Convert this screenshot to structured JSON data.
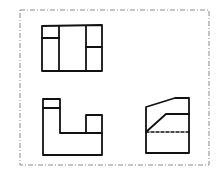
{
  "diagram": {
    "type": "orthographic-three-view-drawing",
    "colors": {
      "line": "#111111",
      "border": "#8a8a8a",
      "background": "#ffffff"
    },
    "border": {
      "style": "dash-dot",
      "x": 20,
      "y": 10,
      "width": 189,
      "height": 155
    },
    "views": [
      {
        "name": "top-view",
        "outline": [
          [
            42,
            26
          ],
          [
            102,
            25
          ],
          [
            102,
            71
          ],
          [
            42,
            71
          ]
        ],
        "lines": [
          [
            [
              59,
              26
            ],
            [
              59,
              71
            ]
          ],
          [
            [
              86,
              26
            ],
            [
              86,
              71
            ]
          ],
          [
            [
              42,
              38
            ],
            [
              59,
              38
            ]
          ],
          [
            [
              86,
              47
            ],
            [
              102,
              47
            ]
          ]
        ],
        "hidden_lines": []
      },
      {
        "name": "front-view",
        "outline": [
          [
            43,
            99
          ],
          [
            60,
            99
          ],
          [
            60,
            133
          ],
          [
            102,
            133
          ],
          [
            102,
            115
          ],
          [
            86,
            115
          ],
          [
            86,
            133
          ],
          [
            102,
            133
          ],
          [
            102,
            155
          ],
          [
            43,
            155
          ]
        ],
        "lines": [
          [
            [
              43,
              108
            ],
            [
              60,
              108
            ]
          ],
          [
            [
              86,
              115
            ],
            [
              102,
              115
            ]
          ],
          [
            [
              86,
              115
            ],
            [
              86,
              133
            ]
          ],
          [
            [
              102,
              115
            ],
            [
              102,
              155
            ]
          ]
        ],
        "hidden_lines": []
      },
      {
        "name": "side-view",
        "outline": [
          [
            146,
            107
          ],
          [
            175,
            98
          ],
          [
            189,
            98
          ],
          [
            189,
            153
          ],
          [
            146,
            153
          ]
        ],
        "lines": [
          [
            [
              146,
              132
            ],
            [
              166,
              114
            ]
          ],
          [
            [
              166,
              114
            ],
            [
              189,
              114
            ]
          ]
        ],
        "hidden_lines": [
          [
            [
              146,
              132
            ],
            [
              189,
              132
            ]
          ]
        ]
      }
    ]
  }
}
